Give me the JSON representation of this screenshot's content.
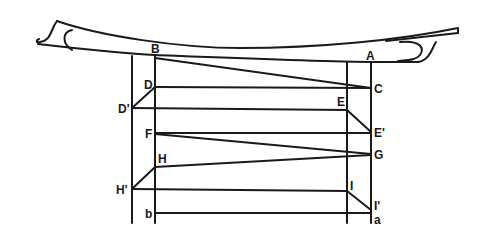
{
  "diagram": {
    "type": "structural-elevation",
    "labels": {
      "A": "A",
      "B": "B",
      "C": "C",
      "D": "D",
      "D_prime": "D'",
      "E": "E",
      "E_prime": "E'",
      "F": "F",
      "G": "G",
      "H": "H",
      "H_prime": "H'",
      "I": "I",
      "I_prime": "I'",
      "a": "a",
      "b": "b"
    },
    "stroke_color": "#1a1a1a",
    "background": "#ffffff"
  }
}
